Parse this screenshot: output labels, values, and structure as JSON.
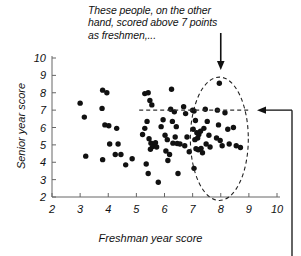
{
  "figure": {
    "annotation": {
      "text": "These people, on the other\nhand, scored above 7 points\nas freshmen,...",
      "arrow_down_name": "callout-arrow-down",
      "arrow_left_name": "callout-arrow-left"
    },
    "colors": {
      "point": "#111111",
      "axis": "#555555",
      "annotation": "#111111",
      "highlight_outline": "#222222",
      "background": "#ffffff"
    }
  },
  "chart_data": {
    "type": "scatter",
    "title": "",
    "xlabel": "Freshman year score",
    "ylabel": "Senior year score",
    "xlim": [
      2,
      10
    ],
    "ylim": [
      2,
      10
    ],
    "xticks": [
      2,
      3,
      4,
      5,
      6,
      7,
      8,
      9,
      10
    ],
    "yticks": [
      2,
      3,
      4,
      5,
      6,
      7,
      8,
      9,
      10
    ],
    "grid": false,
    "legend": null,
    "marker": "filled-circle",
    "points": [
      [
        3.0,
        7.4
      ],
      [
        3.15,
        6.6
      ],
      [
        3.2,
        4.35
      ],
      [
        3.8,
        8.15
      ],
      [
        3.95,
        8.0
      ],
      [
        3.78,
        7.1
      ],
      [
        3.88,
        6.15
      ],
      [
        4.02,
        6.1
      ],
      [
        3.8,
        4.15
      ],
      [
        4.05,
        5.05
      ],
      [
        4.35,
        5.05
      ],
      [
        4.25,
        4.45
      ],
      [
        4.45,
        4.45
      ],
      [
        4.3,
        5.95
      ],
      [
        4.62,
        3.85
      ],
      [
        4.85,
        4.2
      ],
      [
        5.3,
        7.95
      ],
      [
        5.42,
        8.0
      ],
      [
        5.48,
        7.55
      ],
      [
        5.55,
        7.3
      ],
      [
        5.38,
        6.35
      ],
      [
        5.3,
        5.95
      ],
      [
        5.22,
        5.6
      ],
      [
        5.45,
        5.35
      ],
      [
        5.52,
        5.1
      ],
      [
        5.6,
        5.02
      ],
      [
        5.68,
        5.12
      ],
      [
        5.58,
        4.9
      ],
      [
        5.72,
        4.88
      ],
      [
        5.5,
        4.75
      ],
      [
        5.35,
        3.9
      ],
      [
        5.42,
        3.35
      ],
      [
        5.78,
        2.85
      ],
      [
        5.95,
        6.45
      ],
      [
        5.88,
        6.05
      ],
      [
        6.02,
        5.55
      ],
      [
        6.1,
        5.3
      ],
      [
        6.05,
        4.65
      ],
      [
        6.18,
        4.45
      ],
      [
        6.12,
        4.1
      ],
      [
        6.25,
        8.2
      ],
      [
        6.22,
        7.05
      ],
      [
        6.35,
        6.9
      ],
      [
        6.28,
        6.35
      ],
      [
        6.42,
        6.05
      ],
      [
        6.38,
        5.45
      ],
      [
        6.3,
        5.1
      ],
      [
        6.45,
        5.08
      ],
      [
        6.55,
        5.05
      ],
      [
        6.48,
        3.35
      ],
      [
        6.68,
        7.2
      ],
      [
        6.75,
        6.8
      ],
      [
        6.8,
        5.45
      ],
      [
        6.72,
        4.95
      ],
      [
        6.88,
        4.6
      ],
      [
        7.0,
        7.0
      ],
      [
        7.05,
        6.95
      ],
      [
        7.1,
        6.4
      ],
      [
        7.02,
        5.9
      ],
      [
        7.15,
        5.7
      ],
      [
        7.22,
        5.6
      ],
      [
        7.28,
        5.78
      ],
      [
        7.18,
        5.4
      ],
      [
        7.08,
        5.3
      ],
      [
        7.12,
        4.78
      ],
      [
        7.2,
        4.72
      ],
      [
        7.3,
        4.8
      ],
      [
        7.05,
        3.65
      ],
      [
        7.45,
        7.05
      ],
      [
        7.52,
        6.35
      ],
      [
        7.4,
        5.95
      ],
      [
        7.58,
        5.55
      ],
      [
        7.48,
        5.05
      ],
      [
        7.62,
        4.88
      ],
      [
        7.35,
        4.55
      ],
      [
        7.95,
        8.55
      ],
      [
        7.88,
        7.0
      ],
      [
        7.92,
        6.15
      ],
      [
        7.85,
        5.4
      ],
      [
        7.98,
        5.25
      ],
      [
        8.05,
        4.95
      ],
      [
        8.15,
        6.85
      ],
      [
        8.25,
        5.9
      ],
      [
        8.3,
        5.05
      ],
      [
        8.45,
        6.0
      ],
      [
        8.55,
        4.95
      ],
      [
        8.7,
        4.85
      ]
    ],
    "annotations": {
      "highlight_ellipse": {
        "center_x": 7.95,
        "center_y": 5.35,
        "radius_x": 1.03,
        "radius_y": 3.55,
        "style": "dashed"
      },
      "threshold_line": {
        "y": 7.0,
        "x_from": 5.1,
        "x_to": 9.0,
        "style": "dashed"
      },
      "callout_down_x": 8.0,
      "callout_left_y": 7.0
    }
  }
}
